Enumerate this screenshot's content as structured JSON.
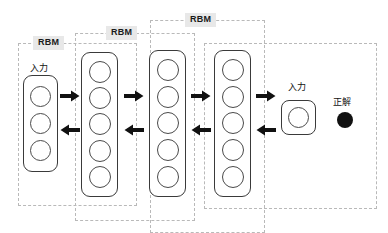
{
  "diagram": {
    "groups": [
      {
        "id": "rbm-1",
        "label": "RBM"
      },
      {
        "id": "rbm-2",
        "label": "RBM"
      },
      {
        "id": "rbm-3",
        "label": "RBM"
      },
      {
        "id": "finetune",
        "label": ""
      }
    ],
    "layers": [
      {
        "id": "layer-1",
        "units": 3,
        "caption": "入力"
      },
      {
        "id": "layer-2",
        "units": 5,
        "caption": ""
      },
      {
        "id": "layer-3",
        "units": 5,
        "caption": ""
      },
      {
        "id": "layer-4",
        "units": 5,
        "caption": ""
      }
    ],
    "output": {
      "unit_caption": "入力",
      "unit_count": 1,
      "target_label": "正解",
      "target_color": "#111111"
    },
    "arrows": {
      "forward_count": 4,
      "backward_count": 4,
      "forward_direction": "right",
      "backward_direction": "left",
      "color": "#111111"
    },
    "colors": {
      "group_border": "#b9b9b9",
      "layer_border": "#3a3a3a",
      "neuron_border": "#4a4a4a",
      "label_chip_bg": "#e8e8e8",
      "background": "#ffffff"
    }
  }
}
